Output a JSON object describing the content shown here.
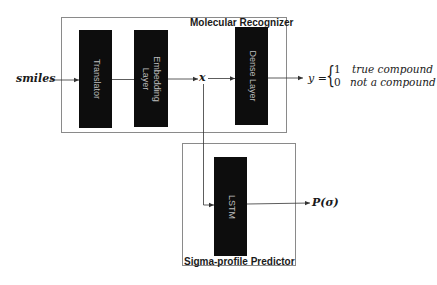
{
  "diagram": {
    "input_label": "smiles",
    "embedding_output_label": "x",
    "groups": [
      {
        "id": "molecular-recognizer",
        "label": "Molecular Recognizer"
      },
      {
        "id": "sigma-profile-predictor",
        "label": "Sigma-profile Predictor"
      }
    ],
    "layers": {
      "translator": "Translator",
      "embedding": "Embedding\nLayer",
      "dense": "Dense Layer",
      "lstm": "LSTM"
    },
    "output_y": {
      "lhs": "y =",
      "brace": "{",
      "cases": [
        {
          "value": "1",
          "description": "true compound"
        },
        {
          "value": "0",
          "description": "not a compound"
        }
      ]
    },
    "output_p": "P(σ)",
    "colors": {
      "layer_fill": "#0d0d0d",
      "layer_text": "#bdbdbd",
      "box_border": "#8a8a8a",
      "line": "#333333"
    }
  }
}
